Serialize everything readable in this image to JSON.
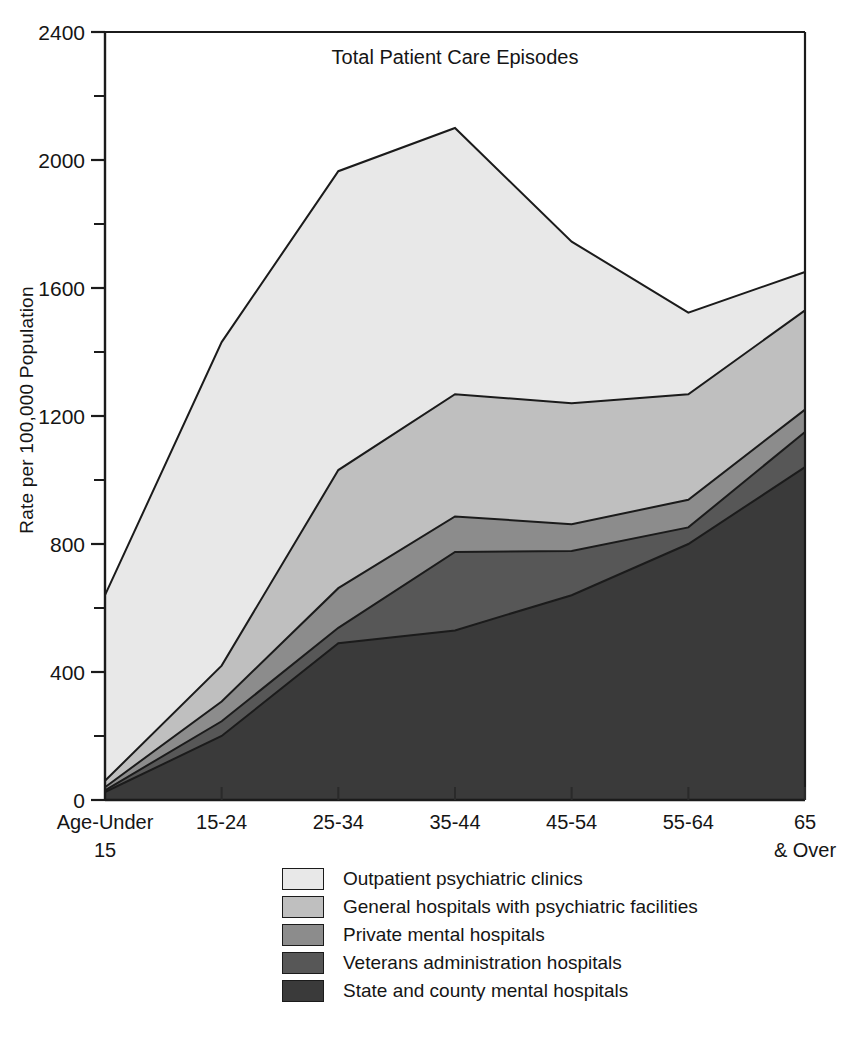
{
  "chart_data": {
    "type": "area",
    "title": "Total Patient Care Episodes",
    "xlabel": "",
    "ylabel": "Rate per 100,000 Population",
    "categories": [
      "Age-Under 15",
      "15-24",
      "25-34",
      "35-44",
      "45-54",
      "55-64",
      "65 & Over"
    ],
    "category_labels_line1": [
      "Age-Under",
      "15-24",
      "25-34",
      "35-44",
      "45-54",
      "55-64",
      "65"
    ],
    "category_labels_line2": [
      "15",
      "",
      "",
      "",
      "",
      "",
      "& Over"
    ],
    "ylim": [
      0,
      2400
    ],
    "yticks": [
      0,
      400,
      800,
      1200,
      1600,
      2000,
      2400
    ],
    "ytick_labels": [
      "0",
      "400",
      "800",
      "1200",
      "1600",
      "2000",
      "2400"
    ],
    "yminor_interval": 200,
    "grid": false,
    "legend_position": "below",
    "stacked": true,
    "stack_order_bottom_to_top": [
      "State and county mental hospitals",
      "Veterans administration hospitals",
      "Private mental hospitals",
      "General hospitals with psychiatric facilities",
      "Outpatient psychiatric clinics"
    ],
    "series": [
      {
        "name": "State and county mental hospitals",
        "color": "#3a3a3a",
        "values": [
          25,
          200,
          490,
          530,
          640,
          800,
          1040
        ]
      },
      {
        "name": "Veterans administration hospitals",
        "color": "#575757",
        "values": [
          30,
          246,
          538,
          775,
          778,
          852,
          1150
        ]
      },
      {
        "name": "Private mental hospitals",
        "color": "#8c8c8c",
        "values": [
          40,
          308,
          662,
          886,
          862,
          938,
          1220
        ]
      },
      {
        "name": "General hospitals with psychiatric facilities",
        "color": "#bfbfbf",
        "values": [
          60,
          420,
          1031,
          1268,
          1240,
          1268,
          1530
        ]
      },
      {
        "name": "Outpatient psychiatric clinics",
        "color": "#e8e8e8",
        "values": [
          640,
          1431,
          1965,
          2100,
          1745,
          1523,
          1650
        ]
      }
    ],
    "cumulative_totals": [
      640,
      1431,
      1965,
      2100,
      1745,
      1523,
      1650
    ]
  },
  "legend": {
    "items": [
      {
        "label": "Outpatient psychiatric clinics",
        "color": "#e8e8e8"
      },
      {
        "label": "General hospitals with psychiatric facilities",
        "color": "#bfbfbf"
      },
      {
        "label": "Private mental hospitals",
        "color": "#8c8c8c"
      },
      {
        "label": "Veterans administration hospitals",
        "color": "#575757"
      },
      {
        "label": "State and county mental hospitals",
        "color": "#3a3a3a"
      }
    ]
  },
  "colors": {
    "axis": "#1b1b1b",
    "background": "#ffffff",
    "text": "#151515"
  }
}
